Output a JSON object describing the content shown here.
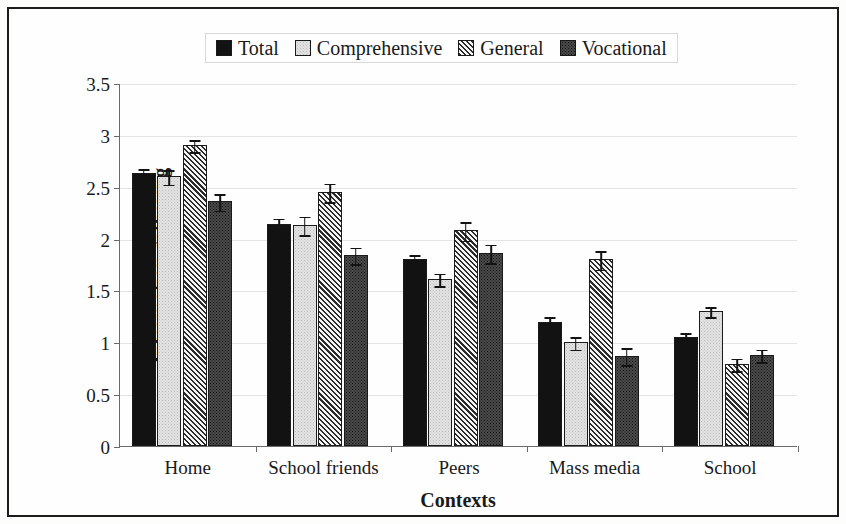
{
  "chart_data": {
    "type": "bar",
    "title": "",
    "xlabel": "Contexts",
    "ylabel": "Information gathering",
    "ylim": [
      0,
      3.5
    ],
    "yticks": [
      "0",
      "0.5",
      "1",
      "1.5",
      "2",
      "2.5",
      "3",
      "3.5"
    ],
    "ytick_values": [
      0,
      0.5,
      1,
      1.5,
      2,
      2.5,
      3,
      3.5
    ],
    "grid": true,
    "legend_position": "top-center",
    "categories": [
      "Home",
      "School friends",
      "Peers",
      "Mass media",
      "School"
    ],
    "series": [
      {
        "name": "Total",
        "pattern": "solid-black",
        "values": [
          2.63,
          2.14,
          1.8,
          1.2,
          1.05
        ],
        "errors": [
          0.05,
          0.06,
          0.05,
          0.05,
          0.05
        ]
      },
      {
        "name": "Comprehensive",
        "pattern": "light-stipple",
        "values": [
          2.6,
          2.13,
          1.61,
          1.0,
          1.3
        ],
        "errors": [
          0.07,
          0.09,
          0.06,
          0.06,
          0.05
        ]
      },
      {
        "name": "General",
        "pattern": "diagonal-hatch",
        "values": [
          2.9,
          2.45,
          2.08,
          1.8,
          0.79
        ],
        "errors": [
          0.06,
          0.09,
          0.09,
          0.09,
          0.06
        ]
      },
      {
        "name": "Vocational",
        "pattern": "dark-stipple",
        "values": [
          2.36,
          1.84,
          1.86,
          0.87,
          0.88
        ],
        "errors": [
          0.08,
          0.08,
          0.09,
          0.08,
          0.06
        ]
      }
    ]
  },
  "colors": {
    "total": "#121212",
    "comprehensive": "#e2e2e2",
    "general": "#f2f2f2",
    "vocational": "#4b4b4b",
    "axis": "#6a6a6a",
    "grid": "#e4e4e4",
    "border": "#1c1c1c"
  }
}
